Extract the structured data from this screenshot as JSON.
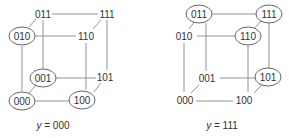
{
  "figure": {
    "cubes": [
      {
        "id": "left",
        "caption_var": "y",
        "caption_eq": " = ",
        "caption_val": "000",
        "nodes": {
          "n000": {
            "label": "000",
            "circled": true
          },
          "n001": {
            "label": "001",
            "circled": true
          },
          "n010": {
            "label": "010",
            "circled": true
          },
          "n011": {
            "label": "011",
            "circled": false
          },
          "n100": {
            "label": "100",
            "circled": true
          },
          "n101": {
            "label": "101",
            "circled": false
          },
          "n110": {
            "label": "110",
            "circled": false
          },
          "n111": {
            "label": "111",
            "circled": false
          }
        }
      },
      {
        "id": "right",
        "caption_var": "y",
        "caption_eq": " = ",
        "caption_val": "111",
        "nodes": {
          "n000": {
            "label": "000",
            "circled": false
          },
          "n001": {
            "label": "001",
            "circled": false
          },
          "n010": {
            "label": "010",
            "circled": false
          },
          "n011": {
            "label": "011",
            "circled": true
          },
          "n100": {
            "label": "100",
            "circled": false
          },
          "n101": {
            "label": "101",
            "circled": true
          },
          "n110": {
            "label": "110",
            "circled": true
          },
          "n111": {
            "label": "111",
            "circled": true
          }
        }
      }
    ],
    "colors": {
      "edge": "#888888",
      "ring": "#555555",
      "text": "#333333"
    }
  }
}
